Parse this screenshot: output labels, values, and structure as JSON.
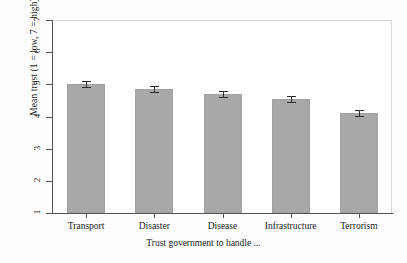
{
  "chart_data": {
    "type": "bar",
    "title": "",
    "xlabel": "Trust government to handle ...",
    "ylabel": "Mean trust (1 = low, 7 = high)",
    "categories": [
      "Transport",
      "Disaster",
      "Disease",
      "Infrastructure",
      "Terrorism"
    ],
    "values": [
      5.0,
      4.85,
      4.7,
      4.55,
      4.1
    ],
    "errors": [
      0.09,
      0.09,
      0.09,
      0.09,
      0.09
    ],
    "error_type": "error-bar-with-caps",
    "ylim": [
      1,
      7
    ],
    "yticks": [
      1,
      2,
      3,
      4,
      5,
      6,
      7
    ],
    "yticklabels": [
      "1",
      "2",
      "3",
      "4",
      "5",
      "6",
      "7"
    ],
    "grid": false,
    "legend": false,
    "bar_color": "#a8a8a8",
    "bar_edge_color": "#a1a1a1",
    "error_color": "#2b2b2b",
    "axis_color": "#555555",
    "background": "#ffffff"
  }
}
